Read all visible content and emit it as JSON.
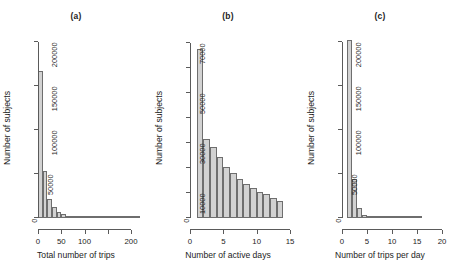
{
  "figure": {
    "background": "#ffffff",
    "bar_fill": "#d2d2d2",
    "bar_stroke": "#6e6e6e",
    "axis_color": "#5a5a5a"
  },
  "panels": [
    {
      "id": "panel-a",
      "title": "(a)",
      "xlabel": "Total number of trips",
      "ylabel": "Number of subjects"
    },
    {
      "id": "panel-b",
      "title": "(b)",
      "xlabel": "Number of active days",
      "ylabel": "Number of subjects"
    },
    {
      "id": "panel-c",
      "title": "(c)",
      "xlabel": "Number of trips per day",
      "ylabel": "Number of subjects"
    }
  ],
  "chart_data": [
    {
      "type": "bar",
      "title": "(a)",
      "xlabel": "Total number of trips",
      "ylabel": "Number of subjects",
      "xlim": [
        0,
        215
      ],
      "ylim": [
        0,
        205000
      ],
      "grid": false,
      "legend": null,
      "xticks": [
        0,
        50,
        100,
        150,
        200
      ],
      "xticklabels": [
        "0",
        "50",
        "100",
        "",
        "200"
      ],
      "yticks": [
        0,
        50000,
        100000,
        150000,
        200000
      ],
      "yticklabels": [
        "0",
        "50000",
        "100000",
        "150000",
        "200000"
      ],
      "bin_width": 10,
      "bin_starts": [
        0,
        10,
        20,
        30,
        40,
        50,
        60,
        70,
        80,
        90,
        100,
        110,
        120,
        130,
        140,
        150,
        160,
        170,
        180,
        190,
        200,
        210
      ],
      "values": [
        168000,
        54000,
        22000,
        12500,
        7000,
        4200,
        2600,
        1700,
        1100,
        800,
        550,
        400,
        300,
        220,
        170,
        130,
        100,
        80,
        60,
        45,
        35,
        25
      ]
    },
    {
      "type": "bar",
      "title": "(b)",
      "xlabel": "Number of active days",
      "ylabel": "Number of subjects",
      "xlim": [
        0,
        15
      ],
      "ylim": [
        0,
        72000
      ],
      "grid": false,
      "legend": null,
      "xticks": [
        0,
        5,
        10,
        15
      ],
      "xticklabels": [
        "0",
        "5",
        "10",
        "15"
      ],
      "yticks": [
        0,
        10000,
        20000,
        30000,
        40000,
        50000,
        60000,
        70000
      ],
      "yticklabels": [
        "0",
        "10000",
        "",
        "30000",
        "",
        "50000",
        "",
        "70000"
      ],
      "bin_width": 1,
      "bin_starts": [
        1,
        2,
        3,
        4,
        5,
        6,
        7,
        8,
        9,
        10,
        11,
        12,
        13
      ],
      "values": [
        67500,
        31500,
        28500,
        24500,
        20500,
        18000,
        15500,
        13500,
        12000,
        10500,
        9500,
        8200,
        6700
      ]
    },
    {
      "type": "bar",
      "title": "(c)",
      "xlabel": "Number of trips per day",
      "ylabel": "Number of subjects",
      "xlim": [
        0,
        20
      ],
      "ylim": [
        0,
        205000
      ],
      "grid": false,
      "legend": null,
      "xticks": [
        0,
        5,
        10,
        15,
        20
      ],
      "xticklabels": [
        "0",
        "5",
        "10",
        "15",
        "20"
      ],
      "yticks": [
        0,
        50000,
        100000,
        150000,
        200000
      ],
      "yticklabels": [
        "0",
        "50000",
        "100000",
        "150000",
        "200000"
      ],
      "bin_width": 1,
      "bin_starts": [
        1,
        2,
        3,
        4,
        5,
        6,
        7,
        8,
        9,
        10,
        11,
        12,
        13,
        14,
        15
      ],
      "values": [
        203000,
        45000,
        11000,
        4000,
        1800,
        900,
        500,
        300,
        180,
        120,
        80,
        50,
        35,
        25,
        15
      ]
    }
  ]
}
